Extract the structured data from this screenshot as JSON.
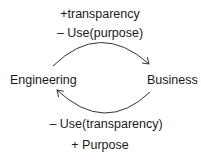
{
  "nodes": {
    "left": "Engineering",
    "right": "Business"
  },
  "top_edge": {
    "line1": "+transparency",
    "line2": "– Use(purpose)",
    "direction": "Engineering to Business"
  },
  "bottom_edge": {
    "line1": "– Use(transparency)",
    "line2": "+ Purpose",
    "direction": "Business to Engineering"
  },
  "colors": {
    "text": "#1a1a1a",
    "arrow": "#333333",
    "background": "#ffffff"
  }
}
